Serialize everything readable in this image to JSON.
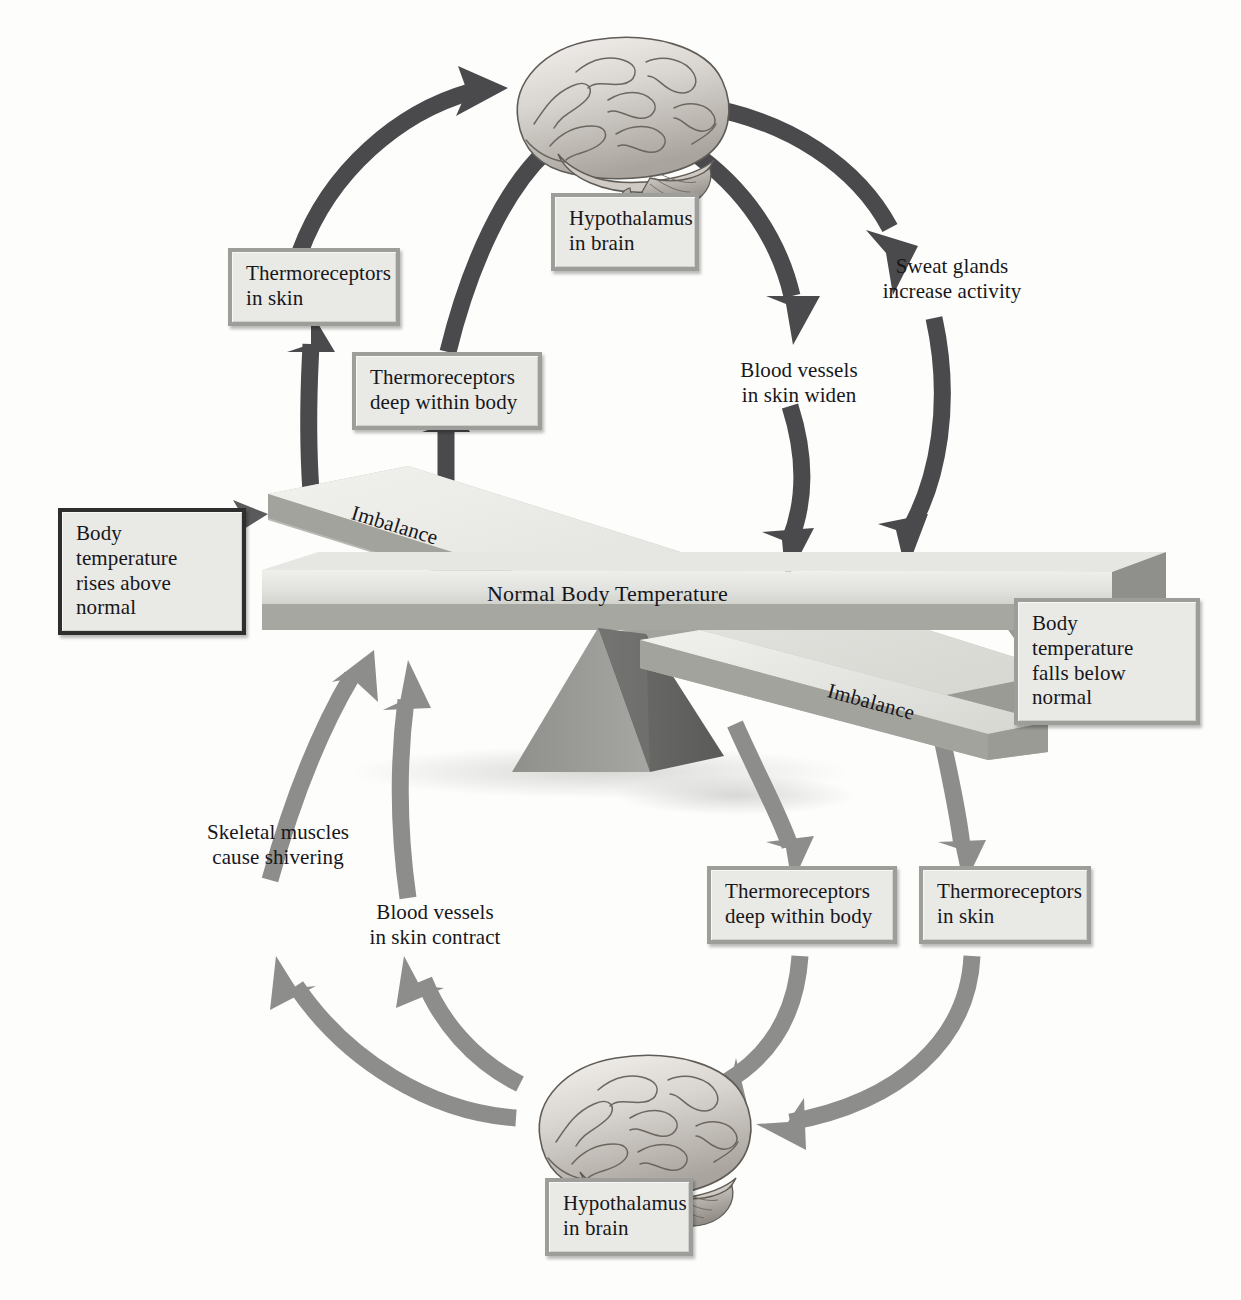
{
  "diagram": {
    "balance": {
      "center_label": "Normal Body Temperature",
      "imbalance_top_label": "Imbalance",
      "imbalance_bottom_label": "Imbalance"
    },
    "triggers": {
      "hot": "Body temperature\nrises above normal",
      "cold": "Body temperature\nfalls below normal"
    },
    "hot_loop": {
      "hypothalamus": "Hypothalamus\nin brain",
      "thermoreceptors_skin": "Thermoreceptors\nin skin",
      "thermoreceptors_deep": "Thermoreceptors\ndeep within body",
      "sweat": "Sweat glands\nincrease activity",
      "vessels": "Blood vessels\nin skin widen"
    },
    "cold_loop": {
      "hypothalamus": "Hypothalamus\nin brain",
      "thermoreceptors_skin": "Thermoreceptors\nin skin",
      "thermoreceptors_deep": "Thermoreceptors\ndeep within body",
      "shivering": "Skeletal muscles\ncause shivering",
      "vessels": "Blood vessels\nin skin contract"
    },
    "icons": {
      "brain_top": "brain-illustration",
      "brain_bottom": "brain-illustration",
      "fulcrum": "pyramid-fulcrum"
    },
    "colors": {
      "arrow_dark": "#4a4a4c",
      "arrow_light": "#8d8d8c",
      "box_fill": "#e9e9e6",
      "box_border": "#9d9d9a",
      "box_border_dark": "#2e2e2e",
      "plank_top": "#e3e3df",
      "plank_edge": "#a9a9a5",
      "fulcrum_light": "#9c9c99",
      "fulcrum_dark": "#6c6c6a",
      "text": "#17171a",
      "background": "#fdfdfc"
    }
  }
}
